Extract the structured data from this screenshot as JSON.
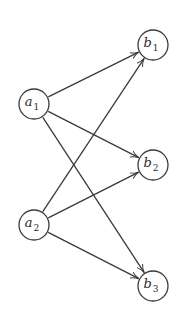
{
  "diagram": {
    "type": "directed-bipartite-graph",
    "colors": {
      "stroke": "#3a3a3a",
      "text": "#2a2a2a",
      "background": "#ffffff"
    },
    "nodes": [
      {
        "id": "a1",
        "base": "a",
        "sub": "1",
        "group": "left"
      },
      {
        "id": "a2",
        "base": "a",
        "sub": "2",
        "group": "left"
      },
      {
        "id": "b1",
        "base": "b",
        "sub": "1",
        "group": "right"
      },
      {
        "id": "b2",
        "base": "b",
        "sub": "2",
        "group": "right"
      },
      {
        "id": "b3",
        "base": "b",
        "sub": "3",
        "group": "right"
      }
    ],
    "edges": [
      {
        "from": "a1",
        "to": "b1"
      },
      {
        "from": "a1",
        "to": "b2"
      },
      {
        "from": "a1",
        "to": "b3"
      },
      {
        "from": "a2",
        "to": "b1"
      },
      {
        "from": "a2",
        "to": "b2"
      },
      {
        "from": "a2",
        "to": "b3"
      }
    ]
  }
}
